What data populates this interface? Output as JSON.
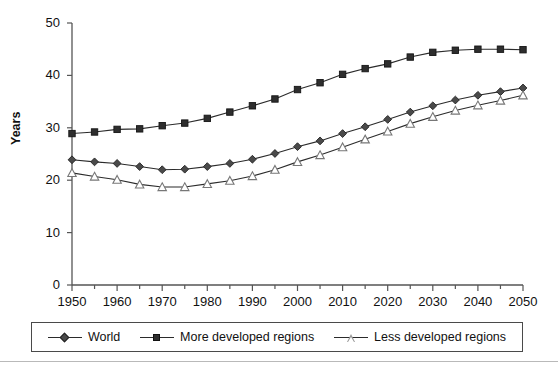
{
  "chart_data": {
    "type": "line",
    "title": "",
    "xlabel": "",
    "ylabel": "Years",
    "xlim": [
      1950,
      2050
    ],
    "ylim": [
      0,
      50
    ],
    "yticks": [
      0,
      10,
      20,
      30,
      40,
      50
    ],
    "ytick_labels": [
      "0",
      "10",
      "20",
      "30",
      "40",
      "50"
    ],
    "x": [
      1950,
      1955,
      1960,
      1965,
      1970,
      1975,
      1980,
      1985,
      1990,
      1995,
      2000,
      2005,
      2010,
      2015,
      2020,
      2025,
      2030,
      2035,
      2040,
      2045,
      2050
    ],
    "xtick_labels": [
      "1950",
      "1960",
      "1970",
      "1980",
      "1990",
      "2000",
      "2010",
      "2020",
      "2030",
      "2040",
      "2050"
    ],
    "xticks_labeled": [
      1950,
      1960,
      1970,
      1980,
      1990,
      2000,
      2010,
      2020,
      2030,
      2040,
      2050
    ],
    "minor_tick_step": 5,
    "grid": false,
    "legend_position": "bottom",
    "series": [
      {
        "name": "World",
        "marker": "diamond",
        "color": "#4a4a4a",
        "values": [
          23.9,
          23.5,
          23.2,
          22.6,
          22.0,
          22.1,
          22.6,
          23.2,
          24.0,
          25.1,
          26.4,
          27.5,
          28.9,
          30.2,
          31.6,
          33.0,
          34.2,
          35.3,
          36.2,
          36.9,
          37.6
        ]
      },
      {
        "name": "More developed regions",
        "marker": "square",
        "color": "#2e2e2e",
        "values": [
          28.9,
          29.2,
          29.7,
          29.8,
          30.4,
          30.9,
          31.8,
          33.0,
          34.2,
          35.5,
          37.3,
          38.6,
          40.2,
          41.3,
          42.2,
          43.5,
          44.4,
          44.8,
          45.0,
          45.0,
          44.9
        ]
      },
      {
        "name": "Less developed regions",
        "marker": "triangle",
        "color": "#9a9a9a",
        "values": [
          21.4,
          20.7,
          20.1,
          19.2,
          18.7,
          18.7,
          19.3,
          19.9,
          20.8,
          22.0,
          23.5,
          24.8,
          26.3,
          27.8,
          29.3,
          30.8,
          32.1,
          33.3,
          34.3,
          35.2,
          36.2
        ]
      }
    ]
  },
  "legend": {
    "items": [
      {
        "label": "World",
        "marker": "diamond-marker"
      },
      {
        "label": "More developed regions",
        "marker": "square-marker"
      },
      {
        "label": "Less developed regions",
        "marker": "triangle-marker"
      }
    ]
  }
}
